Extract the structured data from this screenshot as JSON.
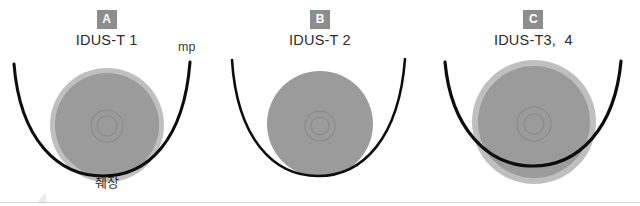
{
  "figure": {
    "background_color": "#ffffff",
    "panel_count": 3
  },
  "style": {
    "badge_bg": "#8d8d8d",
    "badge_text_color": "#ffffff",
    "tumor_fill": "#9a9a9a",
    "halo_fill": "#bdbdbd",
    "wall_stroke": "#0d0d0d",
    "ring_stroke": "#8a8a8a",
    "title_color": "#2b2b2b",
    "baseline_color": "#d9d9d9"
  },
  "panels": [
    {
      "badge": "A",
      "title": "IDUS-T 1",
      "tumor": {
        "cx": 107,
        "cy": 125,
        "r": 52,
        "has_halo": true,
        "halo_r": 57,
        "inner_rings": [
          16,
          10
        ]
      },
      "wall": {
        "label": "mp",
        "crosses_tumor": false
      },
      "annotations": [
        {
          "name": "mp",
          "text": "mp"
        },
        {
          "name": "pancreas",
          "text": "췌장"
        }
      ]
    },
    {
      "badge": "B",
      "title": "IDUS-T 2",
      "tumor": {
        "cx": 107,
        "cy": 124,
        "r": 53,
        "has_halo": false,
        "halo_r": 53,
        "inner_rings": [
          15,
          9
        ]
      },
      "wall": {
        "label": "",
        "crosses_tumor": false
      },
      "annotations": []
    },
    {
      "badge": "C",
      "title": "IDUS-T3,  4",
      "tumor": {
        "cx": 107,
        "cy": 122,
        "r": 56,
        "has_halo": true,
        "halo_r": 62,
        "inner_rings": [
          17,
          10
        ]
      },
      "wall": {
        "label": "",
        "crosses_tumor": true
      },
      "annotations": []
    }
  ]
}
